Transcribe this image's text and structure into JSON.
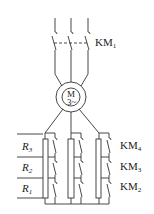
{
  "diagram": {
    "type": "motor rotor-resistance starting circuit",
    "main_contactor": {
      "label": "KM",
      "subscript": "1"
    },
    "motor": {
      "symbol": "M",
      "phase": "3~"
    },
    "resistors": [
      {
        "label": "R",
        "subscript": "3"
      },
      {
        "label": "R",
        "subscript": "2"
      },
      {
        "label": "R",
        "subscript": "1"
      }
    ],
    "contactors": [
      {
        "label": "KM",
        "subscript": "4"
      },
      {
        "label": "KM",
        "subscript": "3"
      },
      {
        "label": "KM",
        "subscript": "2"
      }
    ],
    "colors": {
      "line": "#333333",
      "background": "#ffffff"
    }
  }
}
